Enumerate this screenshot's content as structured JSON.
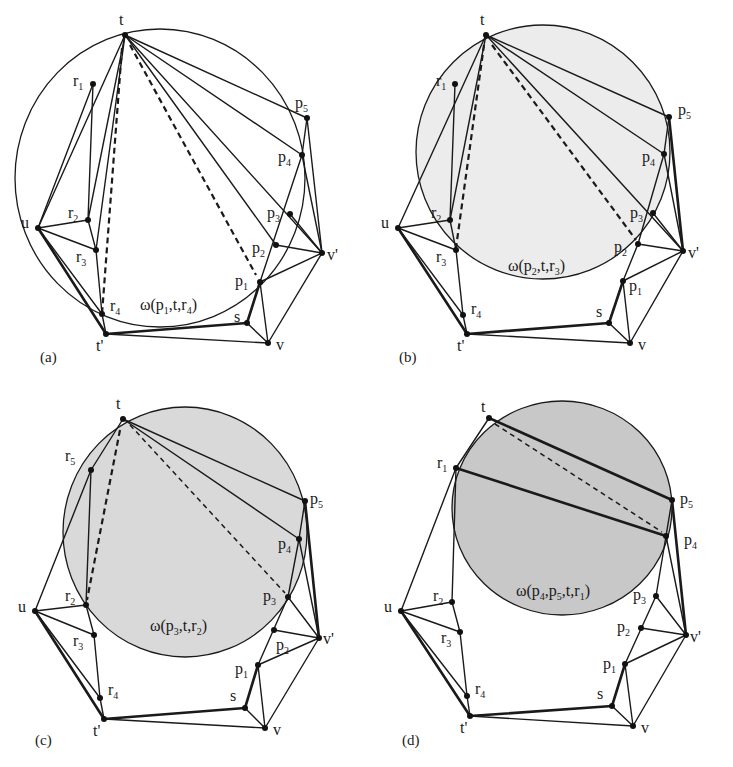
{
  "figure": {
    "panels": [
      {
        "id": "a",
        "caption": "(a)",
        "circle_label": "ω(p1,t,r4)",
        "circle_label_parts": [
          "ω(p",
          "1",
          ",t,r",
          "4",
          ")"
        ],
        "circle_fill": "none",
        "circle": {
          "cx": 160,
          "cy": 178,
          "rx": 145,
          "ry": 149
        },
        "vertices": {
          "t": [
            125,
            35
          ],
          "r1": [
            93,
            84
          ],
          "u": [
            38,
            228
          ],
          "r2": [
            88,
            220
          ],
          "r3": [
            96,
            250
          ],
          "r4": [
            102,
            314
          ],
          "t'": [
            106,
            334
          ],
          "s": [
            247,
            323
          ],
          "v": [
            268,
            343
          ],
          "v'": [
            322,
            253
          ],
          "p1": [
            260,
            282
          ],
          "p2": [
            276,
            245
          ],
          "p3": [
            290,
            214
          ],
          "p4": [
            302,
            155
          ],
          "p5": [
            307,
            118
          ]
        }
      },
      {
        "id": "b",
        "caption": "(b)",
        "circle_label": "ω(p2,t,r3)",
        "circle_label_parts": [
          "ω(p",
          "2",
          ",t,r",
          "3",
          ")"
        ],
        "circle_fill": "#ececec",
        "circle": {
          "cx": 543,
          "cy": 152,
          "rx": 127,
          "ry": 127
        },
        "vertices": {
          "t": [
            486,
            35
          ],
          "r1": [
            455,
            84
          ],
          "u": [
            398,
            228
          ],
          "r2": [
            450,
            220
          ],
          "r3": [
            456,
            250
          ],
          "r4": [
            463,
            315
          ],
          "t'": [
            467,
            334
          ],
          "s": [
            609,
            323
          ],
          "v": [
            630,
            343
          ],
          "v'": [
            683,
            251
          ],
          "p1": [
            623,
            281
          ],
          "p2": [
            638,
            244
          ],
          "p3": [
            653,
            213
          ],
          "p4": [
            664,
            154
          ],
          "p5": [
            669,
            117
          ]
        }
      },
      {
        "id": "c",
        "caption": "(c)",
        "circle_label": "ω(p3,t,r2)",
        "circle_label_parts": [
          "ω(p",
          "3",
          ",t,r",
          "2",
          ")"
        ],
        "circle_fill": "#d9d9d9",
        "circle": {
          "cx": 185,
          "cy": 532,
          "rx": 122,
          "ry": 125
        },
        "vertices": {
          "t": [
            123,
            419
          ],
          "r5": [
            91,
            470
          ],
          "u": [
            35,
            611
          ],
          "r2": [
            86,
            605
          ],
          "r3": [
            94,
            635
          ],
          "r4": [
            100,
            698
          ],
          "t'": [
            104,
            719
          ],
          "s": [
            245,
            708
          ],
          "v": [
            265,
            728
          ],
          "v'": [
            319,
            638
          ],
          "p1": [
            258,
            665
          ],
          "p2": [
            274,
            630
          ],
          "p3": [
            288,
            597
          ],
          "p4": [
            299,
            539
          ],
          "p5": [
            305,
            501
          ]
        }
      },
      {
        "id": "d",
        "caption": "(d)",
        "circle_label": "ω(p4,p5,t,r1)",
        "circle_label_parts": [
          "ω(p",
          "4",
          ",p",
          "5",
          ",t,r",
          "1",
          ")"
        ],
        "circle_fill": "#c8c8c8",
        "circle": {
          "cx": 562,
          "cy": 508,
          "rx": 110,
          "ry": 107
        },
        "vertices": {
          "t": [
            489,
            418
          ],
          "r1": [
            456,
            468
          ],
          "u": [
            401,
            611
          ],
          "r2": [
            452,
            602
          ],
          "r3": [
            460,
            632
          ],
          "r4": [
            467,
            696
          ],
          "t'": [
            470,
            716
          ],
          "s": [
            612,
            706
          ],
          "v": [
            633,
            726
          ],
          "v'": [
            686,
            635
          ],
          "p1": [
            625,
            664
          ],
          "p2": [
            641,
            628
          ],
          "p3": [
            656,
            596
          ],
          "p4": [
            666,
            536
          ],
          "p5": [
            672,
            500
          ]
        }
      }
    ],
    "vertex_labels": [
      "t",
      "r1",
      "r2",
      "r3",
      "r4",
      "r5",
      "u",
      "t'",
      "s",
      "v",
      "v'",
      "p1",
      "p2",
      "p3",
      "p4",
      "p5"
    ]
  }
}
